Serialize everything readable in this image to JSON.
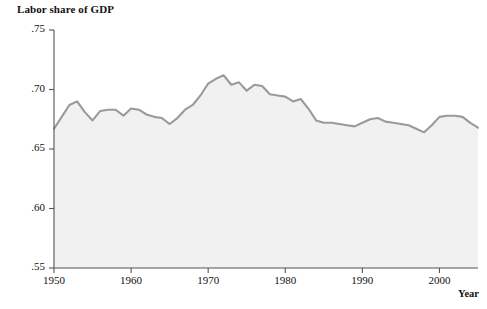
{
  "chart_data": {
    "type": "area",
    "title": "Labor share of GDP",
    "xlabel": "Year",
    "ylabel": "",
    "grid": false,
    "legend": null,
    "xlim": [
      1950,
      2005
    ],
    "ylim": [
      0.55,
      0.75
    ],
    "xticks": [
      1950,
      1960,
      1970,
      1980,
      1990,
      2000
    ],
    "xtick_labels": [
      "1950",
      "1960",
      "1970",
      "1980",
      "1990",
      "2000"
    ],
    "yticks": [
      0.55,
      0.6,
      0.65,
      0.7,
      0.75
    ],
    "ytick_labels": [
      ".55",
      ".60",
      ".65",
      ".70",
      ".75"
    ],
    "line_color": "#9a9a9a",
    "fill_color": "#f1f1f1",
    "axis_color": "#555555",
    "series_name": "Labor share of GDP",
    "x": [
      1950,
      1951,
      1952,
      1953,
      1954,
      1955,
      1956,
      1957,
      1958,
      1959,
      1960,
      1961,
      1962,
      1963,
      1964,
      1965,
      1966,
      1967,
      1968,
      1969,
      1970,
      1971,
      1972,
      1973,
      1974,
      1975,
      1976,
      1977,
      1978,
      1979,
      1980,
      1981,
      1982,
      1983,
      1984,
      1985,
      1986,
      1987,
      1988,
      1989,
      1990,
      1991,
      1992,
      1993,
      1994,
      1995,
      1996,
      1997,
      1998,
      1999,
      2000,
      2001,
      2002,
      2003,
      2004,
      2005
    ],
    "values": [
      0.667,
      0.677,
      0.687,
      0.69,
      0.681,
      0.674,
      0.682,
      0.683,
      0.683,
      0.678,
      0.684,
      0.683,
      0.679,
      0.677,
      0.676,
      0.671,
      0.676,
      0.683,
      0.687,
      0.695,
      0.705,
      0.709,
      0.712,
      0.704,
      0.706,
      0.699,
      0.704,
      0.703,
      0.696,
      0.695,
      0.694,
      0.69,
      0.692,
      0.684,
      0.674,
      0.672,
      0.672,
      0.671,
      0.67,
      0.669,
      0.672,
      0.675,
      0.676,
      0.673,
      0.672,
      0.671,
      0.67,
      0.667,
      0.664,
      0.67,
      0.677,
      0.678,
      0.678,
      0.677,
      0.672,
      0.668
    ]
  },
  "chart": {
    "title": "Labor share of GDP",
    "xaxis_title": "Year"
  }
}
